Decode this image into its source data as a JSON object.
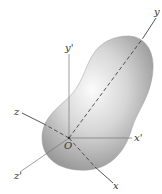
{
  "figure": {
    "origin_label": "O",
    "axes": [
      {
        "name": "x",
        "label": "x"
      },
      {
        "name": "y",
        "label": "y"
      },
      {
        "name": "z",
        "label": "z"
      },
      {
        "name": "x_prime",
        "label": "x'"
      },
      {
        "name": "y_prime",
        "label": "y'"
      },
      {
        "name": "z_prime",
        "label": "z'"
      }
    ],
    "colors": {
      "body_light": "#f2f2f2",
      "body_dark": "#8f8f8f",
      "axis": "#555555"
    }
  }
}
